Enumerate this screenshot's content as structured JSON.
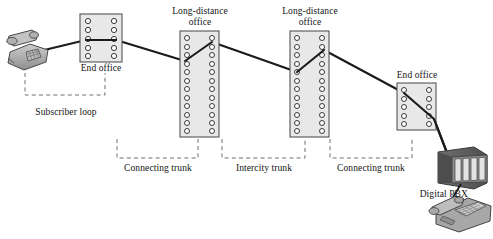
{
  "diagram": {
    "title_none": "",
    "type": "telephone-network-hierarchy",
    "nodes": [
      {
        "id": "subscriber-telephone",
        "icon": "desk-telephone-icon",
        "label": "",
        "x": 8,
        "y": 30
      },
      {
        "id": "end-office-left",
        "label": "End office",
        "kind": "switch-rack",
        "rows": 5,
        "x": 80,
        "y": 14,
        "w": 42,
        "h": 48
      },
      {
        "id": "long-distance-office-1",
        "label": "Long-distance\noffice",
        "label_line1": "Long-distance",
        "label_line2": "office",
        "kind": "switch-rack",
        "rows": 12,
        "x": 180,
        "y": 31,
        "w": 39,
        "h": 106
      },
      {
        "id": "long-distance-office-2",
        "label_line1": "Long-distance",
        "label_line2": "office",
        "kind": "switch-rack",
        "rows": 12,
        "x": 290,
        "y": 31,
        "w": 39,
        "h": 106
      },
      {
        "id": "end-office-right",
        "label": "End office",
        "kind": "switch-rack",
        "rows": 5,
        "x": 397,
        "y": 83,
        "w": 39,
        "h": 47
      },
      {
        "id": "digital-pbx",
        "label": "Digital PBX",
        "icon": "pbx-cabinet-icon",
        "x": 436,
        "y": 148
      },
      {
        "id": "pbx-telephone",
        "icon": "digital-telephone-icon",
        "label": "",
        "x": 440,
        "y": 197
      }
    ],
    "node_labels": {
      "end_office_left": "End office",
      "long_distance_office_1_line1": "Long-distance",
      "long_distance_office_1_line2": "office",
      "long_distance_office_2_line1": "Long-distance",
      "long_distance_office_2_line2": "office",
      "end_office_right": "End office",
      "digital_pbx": "Digital PBX"
    },
    "span_labels": {
      "subscriber_loop": "Subscriber loop",
      "connecting_trunk_left": "Connecting trunk",
      "intercity_trunk": "Intercity trunk",
      "connecting_trunk_right": "Connecting trunk"
    },
    "colors": {
      "line": "#1a1a1a",
      "rack_fill": "#e8e8e8",
      "rack_stroke": "#555555",
      "circle_stroke": "#3a3a3a",
      "dashed": "#6e6e6e",
      "device_body": "#9a9a9a",
      "device_dark": "#5a5a5a",
      "text": "#141414",
      "background": "#ffffff"
    },
    "link_path": "telephone -> end-office-left -> long-distance-office-1 -> long-distance-office-2 -> end-office-right -> digital-pbx -> pbx-telephone"
  }
}
